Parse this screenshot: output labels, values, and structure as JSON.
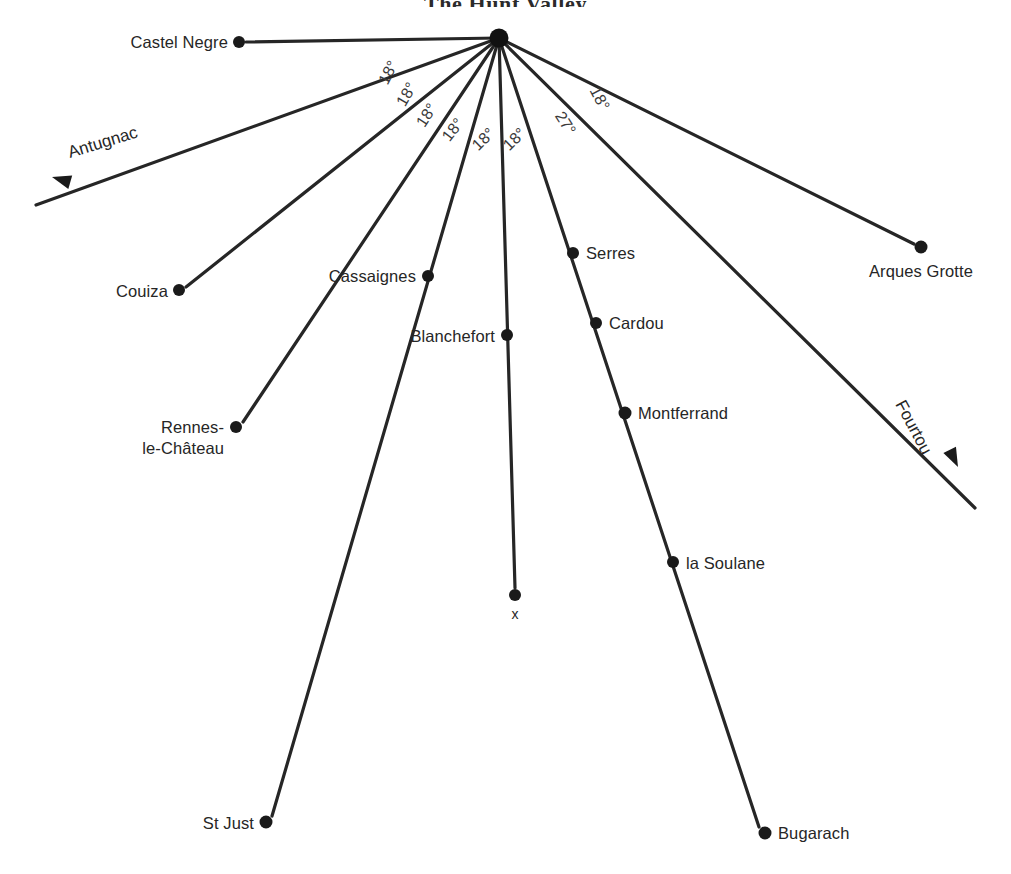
{
  "title": "The Hunt Valley",
  "canvas": {
    "width": 1011,
    "height": 874,
    "background": "#ffffff"
  },
  "colors": {
    "line": "#262626",
    "dot": "#1a1a1a",
    "label": "#262626",
    "angle_label": "#3a3a3a",
    "background": "#ffffff"
  },
  "hub": {
    "name": "hub",
    "x": 499,
    "y": 38,
    "r": 9.5
  },
  "nodes": [
    {
      "id": "castel-negre",
      "label": "Castel Negre",
      "x": 239,
      "y": 42,
      "r": 6.0,
      "label_x": 228,
      "label_y": 48,
      "anchor": "end",
      "lines": [
        "Castel Negre"
      ]
    },
    {
      "id": "couiza",
      "label": "Couiza",
      "x": 179,
      "y": 290,
      "r": 6.0,
      "label_x": 168,
      "label_y": 297,
      "anchor": "end",
      "lines": [
        "Couiza"
      ]
    },
    {
      "id": "cassaignes",
      "label": "Cassaignes",
      "x": 428,
      "y": 276,
      "r": 6.0,
      "label_x": 416,
      "label_y": 282,
      "anchor": "end",
      "lines": [
        "Cassaignes"
      ]
    },
    {
      "id": "rennes-le-chateau",
      "label": "Rennes-le-Château",
      "x": 236,
      "y": 427,
      "r": 6.0,
      "label_x": 224,
      "label_y": 433,
      "anchor": "end",
      "lines": [
        "Rennes-",
        "le-Château"
      ]
    },
    {
      "id": "blanchefort",
      "label": "Blanchefort",
      "x": 507,
      "y": 335,
      "r": 6.0,
      "label_x": 495,
      "label_y": 342,
      "anchor": "end",
      "lines": [
        "Blanchefort"
      ]
    },
    {
      "id": "x-point",
      "label": "x",
      "x": 515,
      "y": 595,
      "r": 6.0,
      "label_x": 515,
      "label_y": 619,
      "anchor": "middle",
      "lines": [
        "x"
      ]
    },
    {
      "id": "st-just",
      "label": "St Just",
      "x": 266,
      "y": 822,
      "r": 6.5,
      "label_x": 254,
      "label_y": 829,
      "anchor": "end",
      "lines": [
        "St Just"
      ]
    },
    {
      "id": "serres",
      "label": "Serres",
      "x": 573,
      "y": 253,
      "r": 6.0,
      "label_x": 586,
      "label_y": 259,
      "anchor": "start",
      "lines": [
        "Serres"
      ]
    },
    {
      "id": "cardou",
      "label": "Cardou",
      "x": 596,
      "y": 323,
      "r": 6.0,
      "label_x": 609,
      "label_y": 329,
      "anchor": "start",
      "lines": [
        "Cardou"
      ]
    },
    {
      "id": "montferrand",
      "label": "Montferrand",
      "x": 625,
      "y": 413,
      "r": 6.5,
      "label_x": 638,
      "label_y": 419,
      "anchor": "start",
      "lines": [
        "Montferrand"
      ]
    },
    {
      "id": "la-soulane",
      "label": "la Soulane",
      "x": 673,
      "y": 562,
      "r": 6.0,
      "label_x": 686,
      "label_y": 569,
      "anchor": "start",
      "lines": [
        "la Soulane"
      ]
    },
    {
      "id": "bugarach",
      "label": "Bugarach",
      "x": 765,
      "y": 833,
      "r": 6.5,
      "label_x": 778,
      "label_y": 839,
      "anchor": "start",
      "lines": [
        "Bugarach"
      ]
    },
    {
      "id": "arques-grotte",
      "label": "Arques Grotte",
      "x": 921,
      "y": 247,
      "r": 6.5,
      "label_x": 921,
      "label_y": 277,
      "anchor": "middle",
      "lines": [
        "Arques Grotte"
      ]
    }
  ],
  "rays": [
    {
      "id": "ray-castel-negre",
      "from": "hub",
      "to_x": 246,
      "to_y": 42,
      "end_node": "castel-negre"
    },
    {
      "id": "ray-antugnac",
      "from": "hub",
      "to_x": 36,
      "to_y": 205,
      "end_node": null,
      "through": [
        [
          179,
          290
        ]
      ]
    },
    {
      "id": "ray-couiza",
      "from": "hub",
      "to_x": 186,
      "to_y": 287,
      "end_node": "couiza"
    },
    {
      "id": "ray-rennes",
      "from": "hub",
      "to_x": 243,
      "to_y": 422,
      "end_node": "rennes-le-chateau",
      "through": [
        [
          428,
          276
        ]
      ]
    },
    {
      "id": "ray-st-just",
      "from": "hub",
      "to_x": 272,
      "to_y": 816,
      "end_node": "st-just",
      "through": [
        [
          507,
          335
        ]
      ]
    },
    {
      "id": "ray-x",
      "from": "hub",
      "to_x": 515,
      "to_y": 588,
      "end_node": "x-point"
    },
    {
      "id": "ray-bugarach",
      "from": "hub",
      "to_x": 759,
      "to_y": 827,
      "end_node": "bugarach",
      "through": [
        [
          573,
          253
        ],
        [
          596,
          323
        ],
        [
          625,
          413
        ],
        [
          673,
          562
        ]
      ]
    },
    {
      "id": "ray-fourtou",
      "from": "hub",
      "to_x": 975,
      "to_y": 508,
      "end_node": null
    },
    {
      "id": "ray-arques",
      "from": "hub",
      "to_x": 914,
      "to_y": 244,
      "end_node": "arques-grotte"
    }
  ],
  "angle_labels": [
    {
      "id": "angle-1",
      "value": "18°",
      "x": 393,
      "y": 75,
      "rotate": -63
    },
    {
      "id": "angle-2",
      "value": "18°",
      "x": 411,
      "y": 97,
      "rotate": -60
    },
    {
      "id": "angle-3",
      "value": "18°",
      "x": 431,
      "y": 118,
      "rotate": -57
    },
    {
      "id": "angle-4",
      "value": "18°",
      "x": 457,
      "y": 133,
      "rotate": -52
    },
    {
      "id": "angle-5",
      "value": "18°",
      "x": 487,
      "y": 143,
      "rotate": -44
    },
    {
      "id": "angle-6",
      "value": "18°",
      "x": 518,
      "y": 143,
      "rotate": -44
    },
    {
      "id": "angle-7",
      "value": "27°",
      "x": 561,
      "y": 126,
      "rotate": 58
    },
    {
      "id": "angle-8",
      "value": "18°",
      "x": 595,
      "y": 101,
      "rotate": 62
    }
  ],
  "direction_markers": [
    {
      "id": "antugnac",
      "label": "Antugnac",
      "label_x": 70,
      "label_y": 158,
      "rotate": -17,
      "arrow": {
        "x": 52,
        "y": 177,
        "angle": 196
      }
    },
    {
      "id": "fourtou",
      "label": "Fourtou",
      "label_x": 895,
      "label_y": 404,
      "rotate": 62,
      "arrow": {
        "x": 958,
        "y": 467,
        "angle": 64
      }
    }
  ]
}
